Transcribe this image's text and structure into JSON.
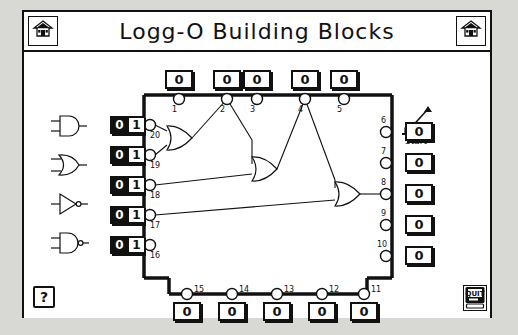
{
  "window": {
    "title": "Logg-O Building Blocks",
    "home_icon_left": "home-icon",
    "home_icon_right": "home-icon"
  },
  "palette": {
    "gates": [
      {
        "name": "and-gate",
        "label": "AND"
      },
      {
        "name": "or-gate",
        "label": "OR"
      },
      {
        "name": "not-gate",
        "label": "NOT"
      },
      {
        "name": "nand-gate",
        "label": "NAND"
      }
    ]
  },
  "start": {
    "label": "Start",
    "icon": "lever-switch-icon"
  },
  "switches": [
    {
      "node": "20",
      "off": "0",
      "on": "1"
    },
    {
      "node": "19",
      "off": "0",
      "on": "1"
    },
    {
      "node": "18",
      "off": "0",
      "on": "1"
    },
    {
      "node": "17",
      "off": "0",
      "on": "1"
    },
    {
      "node": "16",
      "off": "0",
      "on": "1"
    }
  ],
  "top_ports": [
    {
      "node": "1",
      "value": "0"
    },
    {
      "node": "2",
      "value": "0"
    },
    {
      "node": "3",
      "value": "0"
    },
    {
      "node": "4",
      "value": "0"
    },
    {
      "node": "5",
      "value": "0"
    }
  ],
  "right_ports": [
    {
      "node": "6",
      "value": "0"
    },
    {
      "node": "7",
      "value": "0"
    },
    {
      "node": "8",
      "value": "0"
    },
    {
      "node": "9",
      "value": "0"
    },
    {
      "node": "10",
      "value": "0"
    }
  ],
  "bottom_ports": [
    {
      "node": "15",
      "value": "0"
    },
    {
      "node": "14",
      "value": "0"
    },
    {
      "node": "13",
      "value": "0"
    },
    {
      "node": "12",
      "value": "0"
    },
    {
      "node": "11",
      "value": "0"
    }
  ],
  "toolbar": {
    "help_label": "?",
    "quit_label": "QUIT"
  },
  "colors": {
    "ink": "#111111",
    "paper": "#ffffff",
    "desktop": "#d8d8d4"
  }
}
